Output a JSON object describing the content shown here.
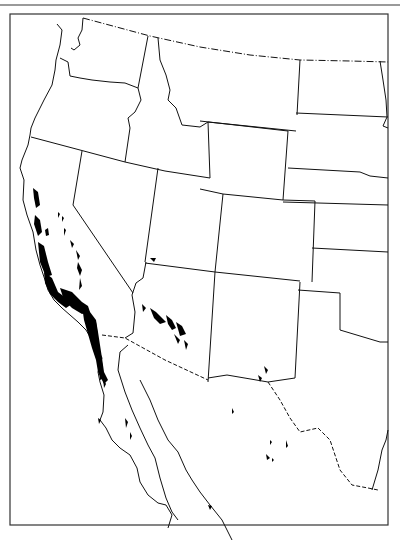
{
  "map": {
    "title": "Range map, western North America",
    "frame_color": "#333333",
    "line_color": "#111111",
    "range_fill": "#000000",
    "background": "#ffffff",
    "border_styles": {
      "state": "solid",
      "international": "dash-dot"
    },
    "regions": [
      "Washington",
      "Oregon",
      "California",
      "Idaho",
      "Nevada",
      "Utah",
      "Arizona",
      "Montana",
      "Wyoming",
      "Colorado",
      "New Mexico",
      "North Dakota",
      "South Dakota",
      "Nebraska",
      "Kansas",
      "Oklahoma",
      "Texas",
      "Baja California",
      "Sonora",
      "Chihuahua"
    ],
    "range_areas": [
      "California Coast Ranges",
      "Sierra Nevada foothills",
      "Southern California mountains",
      "Northern Baja California",
      "Arizona central highlands",
      "Scattered Mexico localities"
    ]
  }
}
